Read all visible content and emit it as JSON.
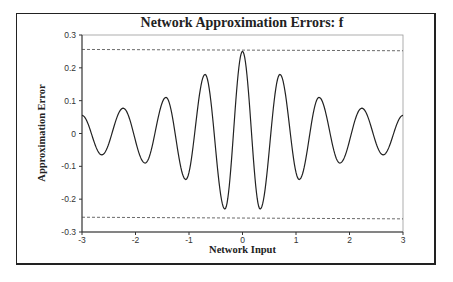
{
  "chart_data": {
    "type": "line",
    "title": "Network Approximation Errors: f",
    "xlabel": "Network Input",
    "ylabel": "Approximation Error",
    "xlim": [
      -3,
      3
    ],
    "ylim": [
      -0.3,
      0.3
    ],
    "x_ticks": [
      "-3",
      "-2",
      "-1",
      "0",
      "1",
      "2",
      "3"
    ],
    "y_ticks": [
      "0.3",
      "0.2",
      "0.1",
      "0",
      "-0.1",
      "-0.2",
      "-0.3"
    ],
    "grid": false,
    "legend": null,
    "series": [
      {
        "name": "error",
        "style": "solid",
        "x": [
          -3,
          -2.63,
          -2.23,
          -1.82,
          -1.43,
          -1.06,
          -0.7,
          -0.33,
          0,
          0.33,
          0.7,
          1.06,
          1.43,
          1.82,
          2.23,
          2.63,
          3
        ],
        "y": [
          0.055,
          -0.065,
          0.077,
          -0.09,
          0.11,
          -0.14,
          0.18,
          -0.23,
          0.25,
          -0.23,
          0.18,
          -0.14,
          0.11,
          -0.09,
          0.077,
          -0.065,
          0.055
        ]
      },
      {
        "name": "upper bound",
        "style": "dashed",
        "x": [
          -3,
          3
        ],
        "y": [
          0.256,
          0.252
        ]
      },
      {
        "name": "lower bound",
        "style": "dashed",
        "x": [
          -3,
          3
        ],
        "y": [
          -0.255,
          -0.26
        ]
      }
    ]
  }
}
